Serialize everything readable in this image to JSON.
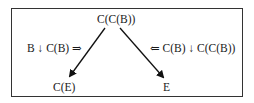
{
  "diagram": {
    "top_node": "C(C(B))",
    "bottom_left_node": "C(E)",
    "bottom_right_node": "E",
    "left_edge_label": "B ↓ C(B) ⇒",
    "right_edge_label": "⇐ C(B) ↓ C(C(B))",
    "edges": [
      {
        "from": "C(C(B))",
        "to": "C(E)",
        "label": "B ↓ C(B) ⇒"
      },
      {
        "from": "C(C(B))",
        "to": "E",
        "label": "⇐ C(B) ↓ C(C(B))"
      }
    ]
  }
}
